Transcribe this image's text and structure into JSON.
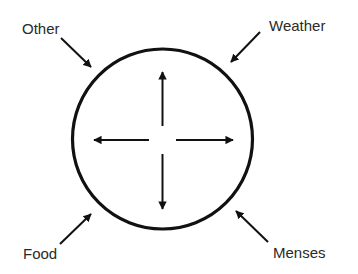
{
  "diagram": {
    "center_label": "",
    "inner_arrows": [
      "up",
      "right",
      "down",
      "left"
    ],
    "labels": {
      "top_left": "Other",
      "top_right": "Weather",
      "bottom_left": "Food",
      "bottom_right": "Menses"
    },
    "colors": {
      "stroke": "#111111",
      "text": "#2a2a2a",
      "background": "#ffffff"
    }
  }
}
